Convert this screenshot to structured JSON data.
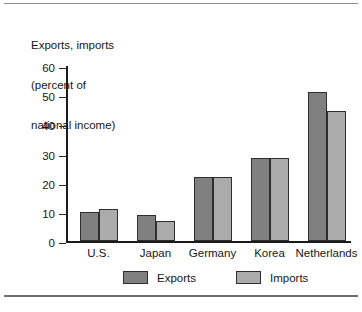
{
  "chart_data": {
    "type": "bar",
    "title": "Exports, imports\n(percent of\nnational income)",
    "title_lines": [
      "Exports, imports",
      "(percent of",
      "national income)"
    ],
    "xlabel": "",
    "ylabel": "Exports, imports (percent of national income)",
    "ylim": [
      0,
      60
    ],
    "yticks": [
      0,
      10,
      20,
      30,
      40,
      50,
      60
    ],
    "ytick_labels": [
      "0",
      "10",
      "20",
      "30",
      "40",
      "50",
      "60"
    ],
    "grid": false,
    "legend_position": "bottom",
    "categories": [
      "U.S.",
      "Japan",
      "Germany",
      "Korea",
      "Netherlands"
    ],
    "series": [
      {
        "name": "Exports",
        "color": "#808080",
        "values": [
          10,
          9,
          22,
          28.5,
          51
        ]
      },
      {
        "name": "Imports",
        "color": "#ababab",
        "values": [
          11,
          7,
          22,
          28.5,
          44.5
        ]
      }
    ]
  },
  "legend": {
    "items": [
      {
        "label": "Exports",
        "swatch": "exports"
      },
      {
        "label": "Imports",
        "swatch": "imports"
      }
    ]
  }
}
